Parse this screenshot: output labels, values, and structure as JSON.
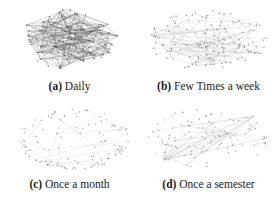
{
  "figure": {
    "panels": [
      {
        "id": "a",
        "label": "(a)",
        "caption": "Daily",
        "graph": {
          "cx": 70,
          "cy": 39,
          "rx": 52,
          "ry": 30,
          "nodes": 95,
          "edges": 260,
          "edge_color": "#555555",
          "edge_opacity": 0.55,
          "node_color": "#444444",
          "seed": 11,
          "layout": "dense"
        }
      },
      {
        "id": "b",
        "label": "(b)",
        "caption": "Few Times a week",
        "graph": {
          "cx": 69,
          "cy": 40,
          "rx": 60,
          "ry": 30,
          "nodes": 140,
          "edges": 230,
          "edge_color": "#888888",
          "edge_opacity": 0.35,
          "node_color": "#666666",
          "seed": 23,
          "layout": "uniform"
        }
      },
      {
        "id": "c",
        "label": "(c)",
        "caption": "Once a month",
        "graph": {
          "cx": 74,
          "cy": 37,
          "rx": 56,
          "ry": 30,
          "nodes": 120,
          "edges": 55,
          "edge_color": "#aaaaaa",
          "edge_opacity": 0.4,
          "node_color": "#777777",
          "seed": 37,
          "layout": "ring"
        }
      },
      {
        "id": "d",
        "label": "(d)",
        "caption": "Once a semester",
        "graph": {
          "cx": 70,
          "cy": 36,
          "rx": 62,
          "ry": 30,
          "nodes": 110,
          "edges": 60,
          "edge_color": "#aaaaaa",
          "edge_opacity": 0.4,
          "node_color": "#777777",
          "seed": 51,
          "layout": "hubs"
        }
      }
    ]
  }
}
